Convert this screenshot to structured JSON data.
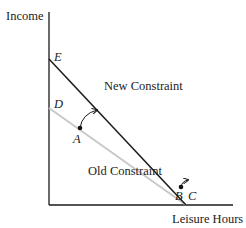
{
  "diagram": {
    "type": "budget-constraint",
    "axes": {
      "y_label": "Income",
      "x_label": "Leisure Hours"
    },
    "points": {
      "E": "E",
      "D": "D",
      "A": "A",
      "B": "B",
      "C": "C"
    },
    "lines": {
      "new_constraint": "New Constraint",
      "old_constraint": "Old Constraint"
    },
    "colors": {
      "axis": "#1a1a1a",
      "new_constraint": "#1a1a1a",
      "old_constraint": "#c8c8c8",
      "text": "#222222"
    }
  }
}
